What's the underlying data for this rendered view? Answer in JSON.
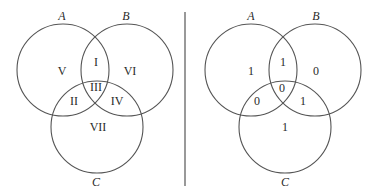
{
  "colors": {
    "stroke": "#555555",
    "text": "#2a2a2a",
    "background": "#ffffff"
  },
  "left_diagram": {
    "set_labels": {
      "a": "A",
      "b": "B",
      "c": "C"
    },
    "regions": {
      "a_only": "V",
      "a_and_b": "I",
      "b_only": "VI",
      "a_b_c": "III",
      "a_and_c": "II",
      "b_and_c": "IV",
      "c_only": "VII"
    }
  },
  "right_diagram": {
    "set_labels": {
      "a": "A",
      "b": "B",
      "c": "C"
    },
    "regions": {
      "a_only": "1",
      "a_and_b": "1",
      "b_only": "0",
      "a_b_c": "0",
      "a_and_c": "0",
      "b_and_c": "1",
      "c_only": "1"
    }
  }
}
